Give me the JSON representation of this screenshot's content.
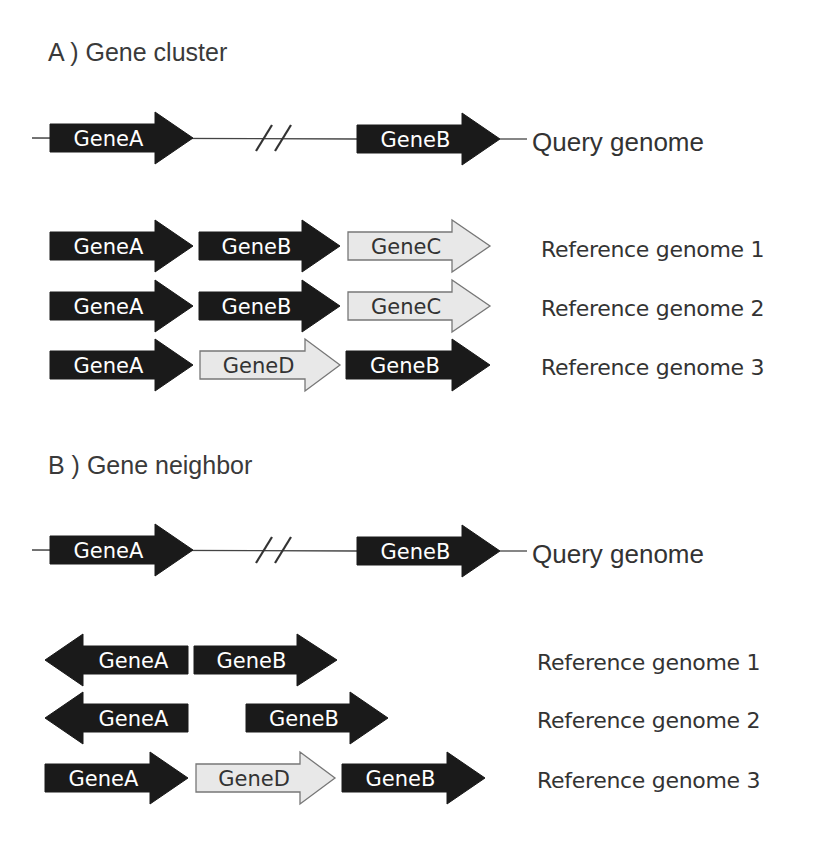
{
  "section_a": {
    "title": "A ) Gene cluster",
    "query": {
      "label": "Query genome",
      "genes": [
        {
          "name": "GeneA",
          "direction": "right",
          "fill": "dark"
        },
        {
          "name": "GeneB",
          "direction": "right",
          "fill": "dark"
        }
      ],
      "break_symbol": "//"
    },
    "references": [
      {
        "label": "Reference genome 1",
        "genes": [
          {
            "name": "GeneA",
            "direction": "right",
            "fill": "dark"
          },
          {
            "name": "GeneB",
            "direction": "right",
            "fill": "dark"
          },
          {
            "name": "GeneC",
            "direction": "right",
            "fill": "light"
          }
        ]
      },
      {
        "label": "Reference genome 2",
        "genes": [
          {
            "name": "GeneA",
            "direction": "right",
            "fill": "dark"
          },
          {
            "name": "GeneB",
            "direction": "right",
            "fill": "dark"
          },
          {
            "name": "GeneC",
            "direction": "right",
            "fill": "light"
          }
        ]
      },
      {
        "label": "Reference genome 3",
        "genes": [
          {
            "name": "GeneA",
            "direction": "right",
            "fill": "dark"
          },
          {
            "name": "GeneD",
            "direction": "right",
            "fill": "light"
          },
          {
            "name": "GeneB",
            "direction": "right",
            "fill": "dark"
          }
        ]
      }
    ]
  },
  "section_b": {
    "title": "B ) Gene neighbor",
    "query": {
      "label": "Query genome",
      "genes": [
        {
          "name": "GeneA",
          "direction": "right",
          "fill": "dark"
        },
        {
          "name": "GeneB",
          "direction": "right",
          "fill": "dark"
        }
      ],
      "break_symbol": "//"
    },
    "references": [
      {
        "label": "Reference genome 1",
        "genes": [
          {
            "name": "GeneA",
            "direction": "left",
            "fill": "dark"
          },
          {
            "name": "GeneB",
            "direction": "right",
            "fill": "dark"
          }
        ]
      },
      {
        "label": "Reference genome 2",
        "genes": [
          {
            "name": "GeneA",
            "direction": "left",
            "fill": "dark"
          },
          {
            "name": "GeneB",
            "direction": "right",
            "fill": "dark"
          }
        ]
      },
      {
        "label": "Reference genome 3",
        "genes": [
          {
            "name": "GeneA",
            "direction": "right",
            "fill": "dark"
          },
          {
            "name": "GeneD",
            "direction": "right",
            "fill": "light"
          },
          {
            "name": "GeneB",
            "direction": "right",
            "fill": "dark"
          }
        ]
      }
    ]
  },
  "colors": {
    "dark_gene_fill": "#1a1a1a",
    "dark_gene_text": "#ffffff",
    "light_gene_fill": "#e8e8e8",
    "light_gene_stroke": "#777777",
    "light_gene_text": "#333333",
    "line": "#444444",
    "text": "#333333"
  }
}
